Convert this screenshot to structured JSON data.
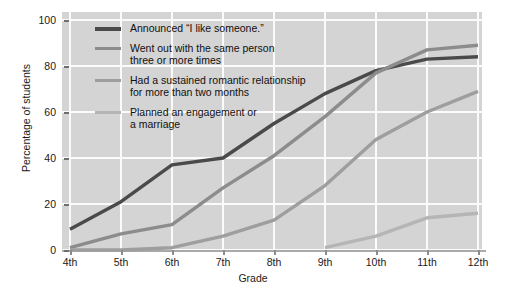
{
  "chart_data": {
    "type": "line",
    "title": "",
    "xlabel": "Grade",
    "ylabel": "Percentage of students",
    "categories": [
      "4th",
      "5th",
      "6th",
      "7th",
      "8th",
      "9th",
      "10th",
      "11th",
      "12th"
    ],
    "ylim": [
      0,
      100
    ],
    "yticks": [
      0,
      20,
      40,
      60,
      80,
      100
    ],
    "grid": true,
    "legend_position": "upper-left-inside",
    "series": [
      {
        "name": "Announced “I like someone.”",
        "color": "#4a4a4a",
        "values": [
          9,
          21,
          37,
          40,
          55,
          68,
          78,
          83,
          84
        ]
      },
      {
        "name": "Went out with the same person\nthree or more times",
        "color": "#8c8c8c",
        "values": [
          1,
          7,
          11,
          27,
          41,
          58,
          77,
          87,
          89
        ]
      },
      {
        "name": "Had a sustained romantic relationship\nfor more than two months",
        "color": "#9e9e9e",
        "values": [
          0,
          0,
          1,
          6,
          13,
          28,
          48,
          60,
          69
        ]
      },
      {
        "name": "Planned an engagement or\na marriage",
        "color": "#b5b5b5",
        "values": [
          null,
          null,
          null,
          null,
          null,
          1,
          6,
          14,
          16
        ]
      }
    ]
  },
  "colors": {
    "plot_background": "#d4d4d4",
    "gridline": "#fbfbfb",
    "page_background": "#ffffff",
    "text": "#1a1a1a"
  }
}
